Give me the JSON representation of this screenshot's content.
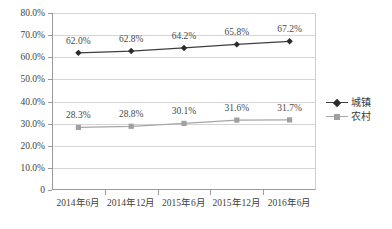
{
  "chart_data": {
    "type": "line",
    "title": "",
    "subtitle": "",
    "xlabel": "",
    "ylabel": "",
    "categories": [
      "2014年6月",
      "2014年12月",
      "2015年6月",
      "2015年12月",
      "2016年6月"
    ],
    "series": [
      {
        "name": "城镇",
        "values": [
          62.0,
          62.8,
          64.2,
          65.8,
          67.2
        ],
        "labels": [
          "62.0%",
          "62.8%",
          "64.2%",
          "65.8%",
          "67.2%"
        ],
        "color": "#3f3f3f",
        "marker": "diamond"
      },
      {
        "name": "农村",
        "values": [
          28.3,
          28.8,
          30.1,
          31.6,
          31.7
        ],
        "labels": [
          "28.3%",
          "28.8%",
          "30.1%",
          "31.6%",
          "31.7%"
        ],
        "color": "#a6a6a6",
        "marker": "square"
      }
    ],
    "ylim": [
      0,
      80
    ],
    "ytick_values": [
      80,
      70,
      60,
      50,
      40,
      30,
      20,
      10,
      0
    ],
    "ytick_labels": [
      "80.0%",
      "70.0%",
      "60.0%",
      "50.0%",
      "40.0%",
      "30.0%",
      "20.0%",
      "10.0%",
      "0"
    ],
    "grid": true,
    "grid_axis": "y",
    "legend_position": "right",
    "data_labels": true,
    "background_color": "#ffffff",
    "gridline_color": "#d5d5d5",
    "axis_color": "#9a9a9a"
  },
  "legend": {
    "items": [
      {
        "label": "城镇"
      },
      {
        "label": "农村"
      }
    ]
  }
}
